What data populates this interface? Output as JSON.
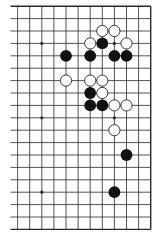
{
  "board": {
    "size": 19,
    "visible_columns": 12,
    "visible_rows": 19,
    "edges": [
      "top",
      "right",
      "bottom"
    ],
    "colors": {
      "background": "#ffffff",
      "line": "#2a2a2a",
      "black_stone": "#111111",
      "white_stone_fill": "#ffffff",
      "white_stone_stroke": "#222222"
    },
    "hoshi": [
      [
        2,
        3
      ],
      [
        8,
        3
      ],
      [
        2,
        9
      ],
      [
        8,
        9
      ],
      [
        2,
        15
      ],
      [
        8,
        15
      ]
    ],
    "black_stones": [
      [
        7,
        3
      ],
      [
        4,
        4
      ],
      [
        6,
        4
      ],
      [
        8,
        4
      ],
      [
        9,
        4
      ],
      [
        6,
        7
      ],
      [
        6,
        8
      ],
      [
        7,
        8
      ],
      [
        9,
        12
      ],
      [
        8,
        15
      ]
    ],
    "white_stones": [
      [
        7,
        2
      ],
      [
        8,
        2
      ],
      [
        6,
        3
      ],
      [
        9,
        3
      ],
      [
        4,
        6
      ],
      [
        6,
        6
      ],
      [
        7,
        6
      ],
      [
        7,
        7
      ],
      [
        8,
        8
      ],
      [
        9,
        8
      ],
      [
        8,
        10
      ]
    ]
  }
}
